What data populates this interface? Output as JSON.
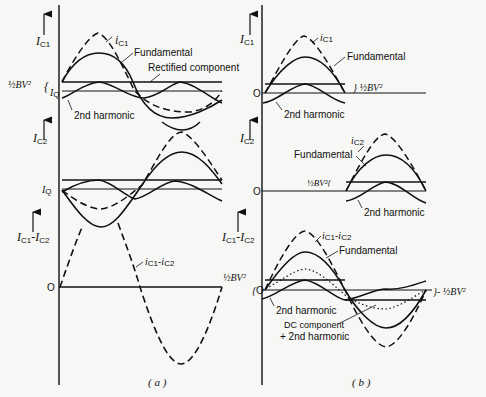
{
  "figure": {
    "panel_a": {
      "caption": "( a )",
      "top": {
        "y_axis_label": "I",
        "y_axis_sub": "C1",
        "curve_label_main": "i",
        "curve_label_sub": "C1",
        "fundamental_label": "Fundamental",
        "rectified_label": "Rectified component",
        "level_label": "½BV²",
        "brace": "{",
        "iq_label": "I",
        "iq_sub": "Q",
        "second_harmonic_label": "2nd harmonic"
      },
      "middle": {
        "y_axis_label": "I",
        "y_axis_sub": "C2",
        "iq_label": "I",
        "iq_sub": "Q"
      },
      "bottom": {
        "y_axis_label": "I",
        "y_axis_sub": "C1",
        "y_axis_label_2": "-I",
        "y_axis_sub_2": "C2",
        "zero_label": "O",
        "curve_label": "i",
        "curve_sub": "C1",
        "curve_label_2": "-i",
        "curve_sub_2": "C2"
      }
    },
    "panel_b": {
      "caption": "( b )",
      "top": {
        "y_axis_label": "I",
        "y_axis_sub": "C1",
        "zero_label": "O",
        "curve_label_main": "i",
        "curve_label_sub": "C1",
        "fundamental_label": "Fundamental",
        "level_label": "} ½BV²",
        "second_harmonic_label": "2nd harmonic"
      },
      "middle": {
        "y_axis_label": "I",
        "y_axis_sub": "C2",
        "zero_label": "O",
        "curve_label_main": "i",
        "curve_label_sub": "C2",
        "fundamental_label": "Fundamental",
        "level_label": "½BV²{",
        "second_harmonic_label": "2nd harmonic"
      },
      "bottom": {
        "y_axis_label": "I",
        "y_axis_sub": "C1",
        "y_axis_label_2": "-I",
        "y_axis_sub_2": "C2",
        "zero_label": "O",
        "level_label_left": "½BV²",
        "brace_left": "{",
        "curve_label": "i",
        "curve_sub": "C1",
        "curve_label_2": "-i",
        "curve_sub_2": "C2",
        "fundamental_label": "Fundamental",
        "level_label_right": "}- ½BV²",
        "second_harmonic_label": "2nd harmonic",
        "dc_label_1": "DC component",
        "dc_label_2": "+ 2nd harmonic"
      }
    }
  }
}
